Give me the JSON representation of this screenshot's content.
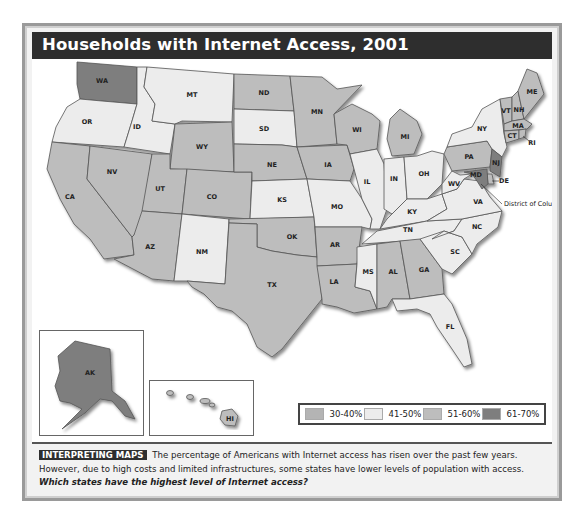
{
  "header": {
    "title": "Households with Internet Access, 2001"
  },
  "colors": {
    "c30_40": "#b4b4b4",
    "c41_50": "#ececec",
    "c51_60": "#bdbdbd",
    "c61_70": "#7e7e7e",
    "title_bg": "#2e2e2e"
  },
  "legend": {
    "items": [
      {
        "label": "30-40%",
        "key": "c30_40"
      },
      {
        "label": "41-50%",
        "key": "c41_50"
      },
      {
        "label": "51-60%",
        "key": "c51_60"
      },
      {
        "label": "61-70%",
        "key": "c61_70"
      }
    ]
  },
  "annotation": {
    "dc": "District of Columbia, 52.8"
  },
  "states": [
    {
      "abbr": "WA",
      "cat": "c61_70"
    },
    {
      "abbr": "OR",
      "cat": "c41_50"
    },
    {
      "abbr": "CA",
      "cat": "c51_60"
    },
    {
      "abbr": "ID",
      "cat": "c41_50"
    },
    {
      "abbr": "NV",
      "cat": "c51_60"
    },
    {
      "abbr": "MT",
      "cat": "c41_50"
    },
    {
      "abbr": "WY",
      "cat": "c51_60"
    },
    {
      "abbr": "UT",
      "cat": "c51_60"
    },
    {
      "abbr": "AZ",
      "cat": "c51_60"
    },
    {
      "abbr": "CO",
      "cat": "c51_60"
    },
    {
      "abbr": "NM",
      "cat": "c41_50"
    },
    {
      "abbr": "ND",
      "cat": "c51_60"
    },
    {
      "abbr": "SD",
      "cat": "c41_50"
    },
    {
      "abbr": "NE",
      "cat": "c51_60"
    },
    {
      "abbr": "KS",
      "cat": "c41_50"
    },
    {
      "abbr": "OK",
      "cat": "c51_60"
    },
    {
      "abbr": "TX",
      "cat": "c51_60"
    },
    {
      "abbr": "MN",
      "cat": "c51_60"
    },
    {
      "abbr": "IA",
      "cat": "c51_60"
    },
    {
      "abbr": "MO",
      "cat": "c41_50"
    },
    {
      "abbr": "AR",
      "cat": "c51_60"
    },
    {
      "abbr": "LA",
      "cat": "c51_60"
    },
    {
      "abbr": "WI",
      "cat": "c51_60"
    },
    {
      "abbr": "IL",
      "cat": "c41_50"
    },
    {
      "abbr": "MI",
      "cat": "c51_60"
    },
    {
      "abbr": "IN",
      "cat": "c41_50"
    },
    {
      "abbr": "OH",
      "cat": "c41_50"
    },
    {
      "abbr": "KY",
      "cat": "c41_50"
    },
    {
      "abbr": "TN",
      "cat": "c41_50"
    },
    {
      "abbr": "MS",
      "cat": "c41_50"
    },
    {
      "abbr": "AL",
      "cat": "c51_60"
    },
    {
      "abbr": "GA",
      "cat": "c51_60"
    },
    {
      "abbr": "FL",
      "cat": "c41_50"
    },
    {
      "abbr": "SC",
      "cat": "c41_50"
    },
    {
      "abbr": "NC",
      "cat": "c41_50"
    },
    {
      "abbr": "VA",
      "cat": "c41_50"
    },
    {
      "abbr": "WV",
      "cat": "c41_50"
    },
    {
      "abbr": "PA",
      "cat": "c51_60"
    },
    {
      "abbr": "NY",
      "cat": "c41_50"
    },
    {
      "abbr": "VT",
      "cat": "c51_60"
    },
    {
      "abbr": "NH",
      "cat": "c51_60"
    },
    {
      "abbr": "ME",
      "cat": "c51_60"
    },
    {
      "abbr": "MA",
      "cat": "c51_60"
    },
    {
      "abbr": "CT",
      "cat": "c51_60"
    },
    {
      "abbr": "RI",
      "cat": "c51_60"
    },
    {
      "abbr": "NJ",
      "cat": "c61_70"
    },
    {
      "abbr": "DE",
      "cat": "c51_60"
    },
    {
      "abbr": "MD",
      "cat": "c61_70"
    },
    {
      "abbr": "AK",
      "cat": "c61_70"
    },
    {
      "abbr": "HI",
      "cat": "c51_60"
    }
  ],
  "caption": {
    "tag": "INTERPRETING MAPS",
    "text": " The percentage of Americans with Internet access has risen over the past few years. However, due to high costs and limited infrastructures, some states have lower levels of population with access. ",
    "question": "Which states have the highest level of Internet access?"
  }
}
